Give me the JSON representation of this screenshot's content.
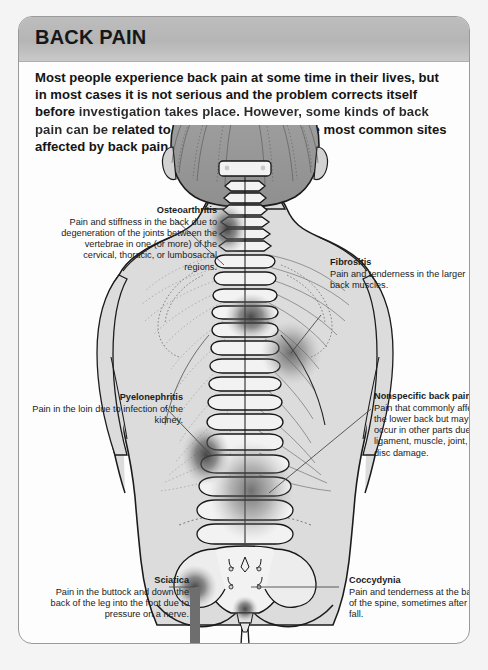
{
  "card": {
    "header_title": "BACK PAIN",
    "intro_line1": "Most people experience back pain at some time in their lives, but in",
    "intro_line2": "most cases it is not serious and the problem corrects itself before",
    "intro_line3": "investigation takes place. However, some kinds of back pain can be",
    "intro_line4": "related to a specific disorder. The most common sites affected by back",
    "intro_line5": "pain are shown here."
  },
  "annotations": [
    {
      "id": "osteoarthritis",
      "title": "Osteoarthritis",
      "body": "Pain and stiffness in the back due to degeneration of the joints between the vertebrae in one (or more) of the cervical, thoracic, or lumbosacral regions.",
      "side": "left"
    },
    {
      "id": "fibrositis",
      "title": "Fibrositis",
      "body": "Pain and tenderness in the larger back muscles.",
      "side": "right"
    },
    {
      "id": "pyelonephritis",
      "title": "Pyelonephritis",
      "body": "Pain in the loin due to infection of the kidney.",
      "side": "left"
    },
    {
      "id": "nonspecific-back-pain",
      "title": "Nonspecific back pain",
      "body": "Pain that commonly affects the lower back but may occur in other parts due to ligament, muscle, joint, or disc damage.",
      "side": "right"
    },
    {
      "id": "sciatica",
      "title": "Sciatica",
      "body": "Pain in the buttock and down the back of the leg into the foot due to pressure on a nerve.",
      "side": "left"
    },
    {
      "id": "coccydynia",
      "title": "Coccydynia",
      "body": "Pain and tenderness at the base of the spine, sometimes after a fall.",
      "side": "right"
    }
  ],
  "figure": {
    "colors": {
      "skin": "#dcdcdc",
      "hair": "#9a9a9a",
      "outline": "#1c1c1c",
      "pain_spot": "#4a4a4a",
      "header_gray": "#b5b5b5",
      "border_gray": "#9a9a9a"
    },
    "pain_sites": [
      {
        "name": "cervical-spot",
        "cx": 205,
        "cy": 105
      },
      {
        "name": "thoracic-spot",
        "cx": 232,
        "cy": 192
      },
      {
        "name": "fibrositis-spot",
        "cx": 268,
        "cy": 222
      },
      {
        "name": "kidney-spot",
        "cx": 187,
        "cy": 330
      },
      {
        "name": "lumbar-spot",
        "cx": 236,
        "cy": 380
      },
      {
        "name": "coccyx-spot",
        "cx": 218,
        "cy": 452
      },
      {
        "name": "sciatica-spot",
        "cx": 176,
        "cy": 462
      }
    ]
  }
}
